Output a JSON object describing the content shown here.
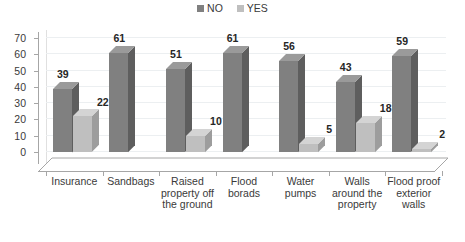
{
  "chart_data": {
    "type": "bar",
    "title": "",
    "subtitle": "",
    "xlabel": "",
    "ylabel": "",
    "ylim": [
      0,
      70
    ],
    "yticks": [
      0,
      10,
      20,
      30,
      40,
      50,
      60,
      70
    ],
    "grid": true,
    "legend_position": "top-center",
    "three_d": true,
    "categories": [
      "Insurance",
      "Sandbags",
      "Raised property off the ground",
      "Flood borads",
      "Water pumps",
      "Walls around the property",
      "Flood proof exterior walls"
    ],
    "series": [
      {
        "name": "NO",
        "color": "#808080",
        "values": [
          39,
          61,
          51,
          61,
          56,
          43,
          59
        ],
        "labels": [
          "39",
          "61",
          "51",
          "61",
          "56",
          "43",
          "59"
        ]
      },
      {
        "name": "YES",
        "color": "#bfbfbf",
        "values": [
          22,
          0,
          10,
          0,
          5,
          18,
          2
        ],
        "labels": [
          "22",
          "",
          "10",
          "",
          "5",
          "18",
          "2"
        ]
      }
    ]
  },
  "legend": {
    "entries": [
      {
        "label": "NO",
        "color": "#808080"
      },
      {
        "label": "YES",
        "color": "#bfbfbf"
      }
    ]
  },
  "axis": {
    "y_tick_labels": [
      "70",
      "60",
      "50",
      "40",
      "30",
      "20",
      "10",
      "0"
    ]
  },
  "colors": {
    "series_no": "#808080",
    "series_no_side": "#5e5e5e",
    "series_no_top": "#9a9a9a",
    "series_yes": "#bfbfbf",
    "series_yes_side": "#9d9d9d",
    "series_yes_top": "#d4d4d4",
    "axis": "#a6a6a6",
    "grid": "#eceff1",
    "text": "#3a3a3a",
    "value_text": "#262626",
    "background": "#ffffff"
  }
}
